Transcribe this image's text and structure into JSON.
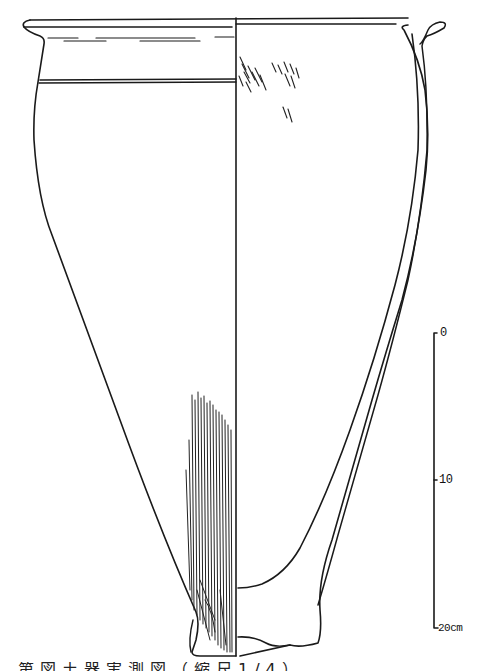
{
  "figure": {
    "type": "archaeological pottery drawing",
    "stroke_color": "#1a1a1a",
    "background": "#ffffff"
  },
  "scale_bar": {
    "ticks": [
      {
        "label": "0",
        "value": 0
      },
      {
        "label": "10",
        "value": 10
      },
      {
        "label": "20cm",
        "value": 20
      }
    ],
    "unit": "cm"
  },
  "caption": {
    "text": "第図土器実測図（縮尺1/4）",
    "clipped": true
  }
}
